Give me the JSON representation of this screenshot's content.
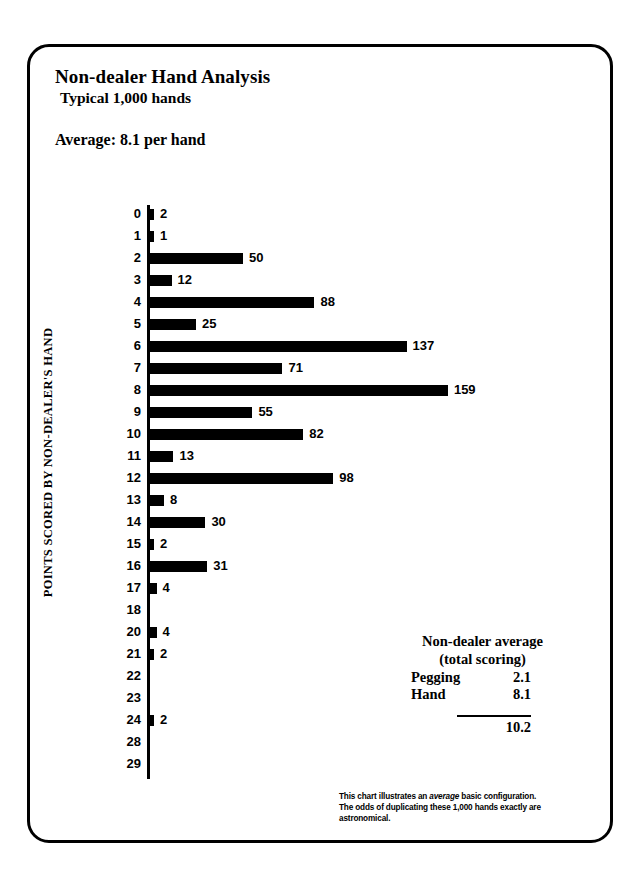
{
  "header": {
    "title": "Non-dealer Hand Analysis",
    "subtitle": "Typical 1,000 hands",
    "average_line": "Average: 8.1 per hand"
  },
  "chart_data": {
    "type": "bar",
    "orientation": "horizontal",
    "title": "Non-dealer Hand Analysis",
    "subtitle": "Typical 1,000 hands",
    "xlabel": "",
    "ylabel": "POINTS SCORED BY NON-DEALER'S HAND",
    "grid": false,
    "legend": "none",
    "xlim": [
      0,
      159
    ],
    "categories": [
      "0",
      "1",
      "2",
      "3",
      "4",
      "5",
      "6",
      "7",
      "8",
      "9",
      "10",
      "11",
      "12",
      "13",
      "14",
      "15",
      "16",
      "17",
      "18",
      "20",
      "21",
      "22",
      "23",
      "24",
      "28",
      "29"
    ],
    "values": [
      2,
      1,
      50,
      12,
      88,
      25,
      137,
      71,
      159,
      55,
      82,
      13,
      98,
      8,
      30,
      2,
      31,
      4,
      0,
      4,
      2,
      0,
      0,
      2,
      0,
      0
    ],
    "value_labels": [
      "2",
      "1",
      "50",
      "12",
      "88",
      "25",
      "137",
      "71",
      "159",
      "55",
      "82",
      "13",
      "98",
      "8",
      "30",
      "2",
      "31",
      "4",
      "",
      "4",
      "2",
      "",
      "",
      "2",
      "",
      ""
    ],
    "bar_color": "#000000",
    "total_hands": 1000
  },
  "yaxis": {
    "caption": "POINTS SCORED BY NON-DEALER'S HAND"
  },
  "summary": {
    "heading": "Non-dealer average",
    "subheading": "(total scoring)",
    "rows": [
      {
        "name": "Pegging",
        "value": "2.1"
      },
      {
        "name": "Hand",
        "value": "8.1"
      }
    ],
    "total": {
      "name": "",
      "value": "10.2"
    }
  },
  "footnote": {
    "line1_a": "This chart illustrates an ",
    "line1_em": "average",
    "line1_b": " basic configuration.",
    "line2": "The odds of duplicating these 1,000 hands exactly are",
    "line3": "astronomical."
  }
}
